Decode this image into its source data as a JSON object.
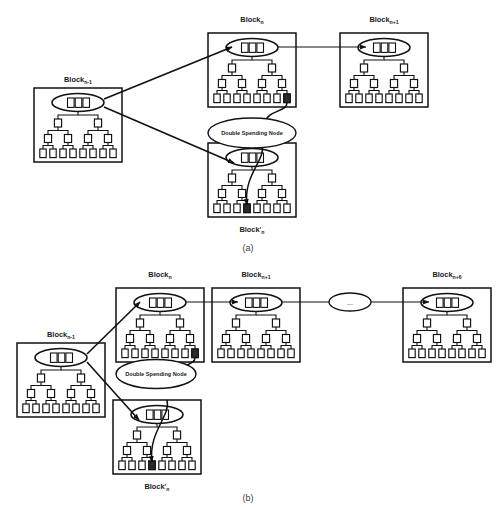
{
  "figure": {
    "type": "diagram",
    "panels": [
      {
        "id": "a",
        "caption": "(a)",
        "blocks": [
          {
            "id": "block-n-minus-1",
            "label": "Block",
            "subscript": "n-1"
          },
          {
            "id": "block-n",
            "label": "Block",
            "subscript": "n"
          },
          {
            "id": "block-n-plus-1",
            "label": "Block",
            "subscript": "n+1"
          },
          {
            "id": "block-n-prime",
            "label": "Block'",
            "subscript": "n"
          }
        ],
        "double_spending_node": {
          "label": "Double Spending Node"
        }
      },
      {
        "id": "b",
        "caption": "(b)",
        "blocks": [
          {
            "id": "block-n-minus-1",
            "label": "Block",
            "subscript": "n-1"
          },
          {
            "id": "block-n",
            "label": "Block",
            "subscript": "n"
          },
          {
            "id": "block-n-plus-1",
            "label": "Block",
            "subscript": "n+1"
          },
          {
            "id": "block-n-plus-6",
            "label": "Block",
            "subscript": "n+6"
          },
          {
            "id": "block-n-prime",
            "label": "Block'",
            "subscript": "n"
          }
        ],
        "double_spending_node": {
          "label": "Double Spending Node"
        },
        "chain_ellipsis": "..."
      }
    ],
    "block_internals": {
      "header_cell_count": 3,
      "merkle_level_1_count": 2,
      "merkle_level_2_count": 4,
      "merkle_leaf_count": 8
    },
    "colors": {
      "stroke": "#111111",
      "fill": "#ffffff",
      "highlight": "#2b2b2b",
      "caption": "#3c3c3c"
    }
  }
}
